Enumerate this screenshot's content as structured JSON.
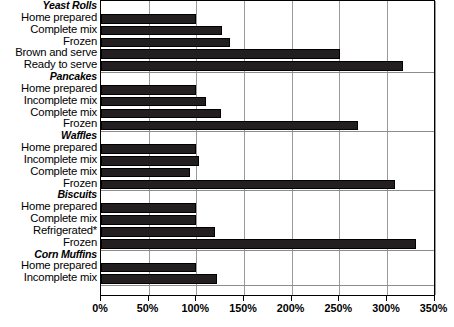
{
  "chart_data": {
    "type": "bar",
    "orientation": "horizontal",
    "title": "",
    "subtitle": "",
    "xlabel": "",
    "ylabel": "",
    "xlim": [
      0,
      350
    ],
    "xtick_labels": [
      "0%",
      "50%",
      "100%",
      "150%",
      "200%",
      "250%",
      "300%",
      "350%"
    ],
    "xtick_values": [
      0,
      50,
      100,
      150,
      200,
      250,
      300,
      350
    ],
    "grid": true,
    "legend": "none",
    "bar_color": "#231f20",
    "groups": [
      {
        "name": "Yeast Rolls",
        "items": [
          {
            "label": "Home prepared",
            "value": 100
          },
          {
            "label": "Complete mix",
            "value": 127
          },
          {
            "label": "Frozen",
            "value": 135
          },
          {
            "label": "Brown and serve",
            "value": 251
          },
          {
            "label": "Ready to serve",
            "value": 317
          }
        ]
      },
      {
        "name": "Pancakes",
        "items": [
          {
            "label": "Home prepared",
            "value": 100
          },
          {
            "label": "Incomplete mix",
            "value": 110
          },
          {
            "label": "Complete mix",
            "value": 126
          },
          {
            "label": "Frozen",
            "value": 270
          }
        ]
      },
      {
        "name": "Waffles",
        "items": [
          {
            "label": "Home prepared",
            "value": 100
          },
          {
            "label": "Incomplete mix",
            "value": 103
          },
          {
            "label": "Complete mix",
            "value": 93
          },
          {
            "label": "Frozen",
            "value": 308
          }
        ]
      },
      {
        "name": "Biscuits",
        "items": [
          {
            "label": "Home prepared",
            "value": 100
          },
          {
            "label": "Complete mix",
            "value": 100
          },
          {
            "label": "Refrigerated*",
            "value": 120
          },
          {
            "label": "Frozen",
            "value": 330
          }
        ]
      },
      {
        "name": "Corn Muffins",
        "items": [
          {
            "label": "Home prepared",
            "value": 100
          },
          {
            "label": "Incomplete mix",
            "value": 122
          }
        ]
      }
    ]
  }
}
